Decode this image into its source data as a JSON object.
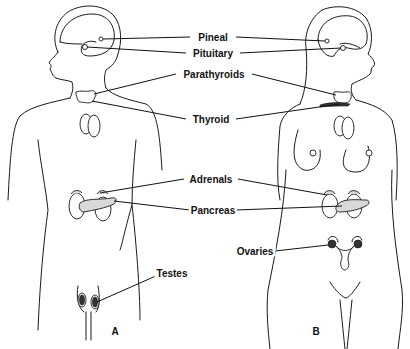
{
  "figures": [
    {
      "id": "A",
      "label": "A",
      "sex": "male"
    },
    {
      "id": "B",
      "label": "B",
      "sex": "female"
    }
  ],
  "labels": {
    "pineal": "Pineal",
    "pituitary": "Pituitary",
    "parathyroids": "Parathyroids",
    "thyroid": "Thyroid",
    "adrenals": "Adrenals",
    "pancreas": "Pancreas",
    "testes": "Testes",
    "ovaries": "Ovaries"
  },
  "figure_labels": {
    "a": "A",
    "b": "B"
  },
  "colors": {
    "line": "#1a1a1a",
    "background": "#ffffff",
    "stipple": "#d9d9d9"
  }
}
